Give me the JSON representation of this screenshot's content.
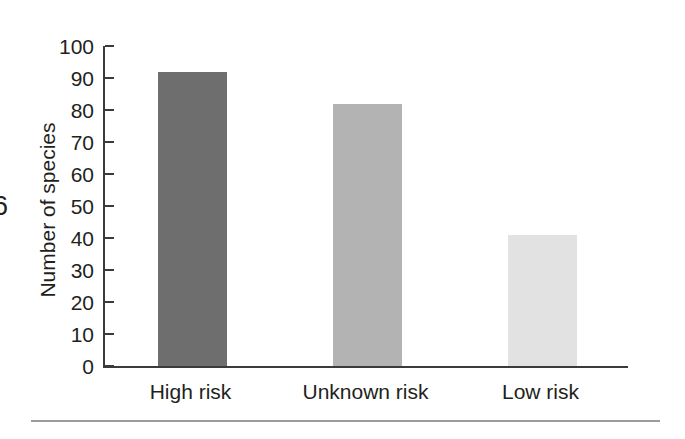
{
  "chart_data": {
    "type": "bar",
    "title": "",
    "subtitle": "",
    "xlabel": "",
    "ylabel": "Number of species",
    "categories": [
      "High risk",
      "Unknown risk",
      "Low risk"
    ],
    "values": [
      92,
      82,
      41
    ],
    "bar_colors": [
      "#6e6e6e",
      "#b3b3b3",
      "#e2e2e2"
    ],
    "ylim": [
      0,
      100
    ],
    "ytick_values": [
      0,
      10,
      20,
      30,
      40,
      50,
      60,
      70,
      80,
      90,
      100
    ],
    "ytick_labels": [
      "0",
      "10",
      "20",
      "30",
      "40",
      "50",
      "60",
      "70",
      "80",
      "90",
      "100"
    ],
    "grid": false,
    "legend": false,
    "legend_position": "none",
    "tick_direction": "in",
    "axis_color": "#3b3b3b",
    "background_color": "#ffffff",
    "text_color": "#231f20"
  },
  "figure": {
    "edge_glyph": "6",
    "rule_color": "#9b9b9b"
  }
}
